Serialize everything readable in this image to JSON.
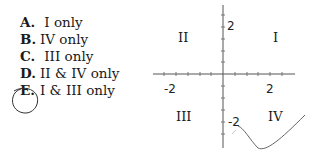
{
  "question": {
    "choices": [
      {
        "letter": "A.",
        "text": " I only"
      },
      {
        "letter": "B.",
        "text": "IV only"
      },
      {
        "letter": "C.",
        "text": " III only"
      },
      {
        "letter": "D.",
        "text": "II & IV only"
      },
      {
        "letter": "E.",
        "text": "I & III only"
      }
    ],
    "circled_choice": "E."
  },
  "graph": {
    "quadrants": {
      "I": "I",
      "II": "II",
      "III": "III",
      "IV": "IV"
    },
    "tick_labels": {
      "y_pos": "2",
      "y_neg": "-2",
      "x_neg": "-2",
      "x_pos": "2"
    }
  }
}
